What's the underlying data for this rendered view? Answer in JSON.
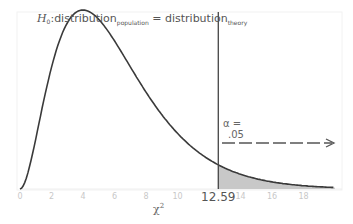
{
  "chart_data": {
    "type": "line",
    "hypothesis": {
      "h": "H",
      "h_sub": "0",
      "lhs": ":distribution",
      "lhs_sub": "population",
      "eq": " = distribution",
      "rhs_sub": "theory"
    },
    "distribution": "chi-square",
    "df": 6,
    "xlabel": "χ",
    "xlabel_sup": "2",
    "ylabel": "",
    "xlim": [
      0,
      20
    ],
    "x_ticks": [
      "0",
      "2",
      "4",
      "6",
      "8",
      "10",
      "14",
      "16",
      "18"
    ],
    "x_tick_values": [
      0,
      2,
      4,
      6,
      8,
      10,
      14,
      16,
      18
    ],
    "critical_value": 12.59,
    "critical_label": "12.59",
    "alpha_label_1": "α =",
    "alpha_label_2": ".05",
    "shaded_region": {
      "from": 12.59,
      "to": 20,
      "color": "#c8c8c8"
    },
    "curve_color": "#3a3a3a",
    "grid": false,
    "legend": null
  }
}
